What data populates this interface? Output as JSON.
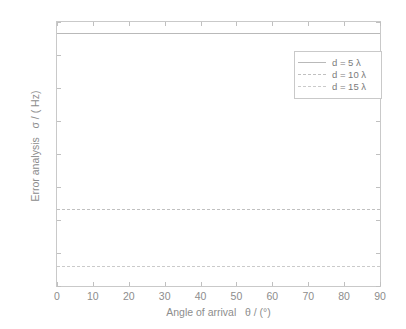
{
  "chart_data": {
    "type": "line",
    "title": "",
    "xlabel": "Angle of arrival   θ / (°)",
    "ylabel": "Error analysis   σ / ( Hz)",
    "xlim": [
      0,
      90
    ],
    "ylim": [
      150,
      550
    ],
    "xticks": [
      0,
      10,
      20,
      30,
      40,
      50,
      60,
      70,
      80,
      90
    ],
    "yticks": [
      150,
      200,
      250,
      300,
      350,
      400,
      450,
      500,
      550
    ],
    "xtick_labels": [
      "0",
      "10",
      "20",
      "30",
      "40",
      "50",
      "60",
      "70",
      "80",
      "90"
    ],
    "ytick_labels": [
      "150",
      "200",
      "250",
      "300",
      "350",
      "400",
      "450",
      "500",
      "550"
    ],
    "grid": false,
    "legend_position": "upper right",
    "x": [
      0,
      10,
      20,
      30,
      40,
      50,
      60,
      70,
      80,
      90
    ],
    "series": [
      {
        "name": "d = 5 λ",
        "style": "solid",
        "color": "#b9b9b9",
        "values": [
          533,
          533,
          533,
          533,
          533,
          533,
          533,
          533,
          533,
          533
        ]
      },
      {
        "name": "d = 10 λ",
        "style": "dashed",
        "color": "#c0c0c0",
        "values": [
          267,
          267,
          267,
          267,
          267,
          267,
          267,
          267,
          267,
          267
        ]
      },
      {
        "name": "d = 15 λ",
        "style": "dotted",
        "color": "#cacaca",
        "values": [
          180,
          180,
          180,
          180,
          180,
          180,
          180,
          180,
          180,
          180
        ]
      }
    ]
  },
  "legend": {
    "entries": [
      {
        "label": "d = 5 λ"
      },
      {
        "label": "d = 10 λ"
      },
      {
        "label": "d = 15 λ"
      }
    ]
  },
  "colors": {
    "background": "#ffffff",
    "axis_border": "#c9c9c9",
    "tick_text": "#8d8d8d",
    "legend_text": "#7b7b7b"
  }
}
